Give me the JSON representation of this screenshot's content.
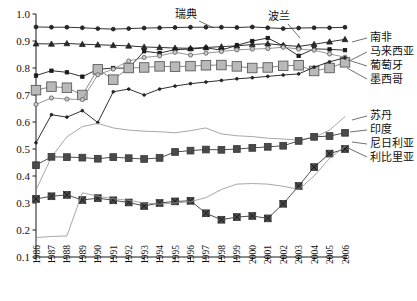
{
  "chart_data": {
    "type": "line",
    "title": "",
    "subtitle": "",
    "xlabel": "",
    "ylabel": "",
    "xlim": [
      1986,
      2006
    ],
    "ylim": [
      0.1,
      1.0
    ],
    "grid": false,
    "legend_position": "inline-annotations",
    "x": [
      1986,
      1987,
      1988,
      1989,
      1990,
      1991,
      1992,
      1993,
      1994,
      1995,
      1996,
      1997,
      1998,
      1999,
      2000,
      2001,
      2002,
      2003,
      2004,
      2005,
      2006
    ],
    "xtick_labels": [
      "1986",
      "1987",
      "1988",
      "1989",
      "1990",
      "1991",
      "1992",
      "1993",
      "1994",
      "1995",
      "1996",
      "1997",
      "1998",
      "1999",
      "2000",
      "2001",
      "2002",
      "2003",
      "2004",
      "2005",
      "2006"
    ],
    "ytick_labels": [
      "0.1",
      "0.2",
      "0.3",
      "0.4",
      "0.5",
      "0.6",
      "0.7",
      "0.8",
      "0.9",
      "1.0"
    ],
    "ytick_values": [
      0.1,
      0.2,
      0.3,
      0.4,
      0.5,
      0.6,
      0.7,
      0.8,
      0.9,
      1.0
    ],
    "series": [
      {
        "name": "瑞典",
        "label": "瑞典",
        "marker": "circle-filled",
        "color": "#1a1a1a",
        "fill": "#2b2b2b",
        "size": 3.1,
        "values": [
          0.952,
          0.951,
          0.951,
          0.949,
          0.946,
          0.944,
          0.946,
          0.948,
          0.949,
          0.95,
          0.951,
          0.951,
          0.951,
          0.95,
          0.952,
          0.949,
          0.946,
          0.948,
          0.949,
          0.949,
          0.951
        ]
      },
      {
        "name": "波兰",
        "label": "波兰",
        "marker": "triangle-filled",
        "color": "#1a1a1a",
        "fill": "#2b2b2b",
        "size": 3.2,
        "values": [
          0.89,
          0.889,
          0.891,
          0.888,
          0.886,
          0.884,
          0.882,
          0.878,
          0.876,
          0.874,
          0.873,
          0.876,
          0.879,
          0.882,
          0.887,
          0.89,
          0.884,
          0.88,
          0.888,
          0.897,
          0.906
        ]
      },
      {
        "name": "南非",
        "label": "南非",
        "marker": "square-small-filled",
        "color": "#1a1a1a",
        "fill": "#1a1a1a",
        "size": 3.0,
        "values": [
          0.772,
          0.79,
          0.784,
          0.768,
          0.795,
          0.8,
          0.799,
          0.862,
          0.855,
          0.868,
          0.87,
          0.875,
          0.866,
          0.884,
          0.9,
          0.911,
          0.882,
          0.845,
          0.871,
          0.869,
          0.866
        ]
      },
      {
        "name": "马来西亚",
        "label": "马来西亚",
        "marker": "square-large-gray",
        "color": "#7a7a7a",
        "fill": "#b9b9b9",
        "size": 5.0,
        "values": [
          0.718,
          0.731,
          0.727,
          0.7,
          0.795,
          0.757,
          0.8,
          0.802,
          0.806,
          0.805,
          0.807,
          0.81,
          0.811,
          0.806,
          0.8,
          0.802,
          0.808,
          0.81,
          0.789,
          0.8,
          0.821
        ]
      },
      {
        "name": "葡萄牙",
        "label": "葡萄牙",
        "marker": "circle-small-gray",
        "color": "#8a8a8a",
        "fill": "#c9c9c9",
        "size": 2.9,
        "values": [
          0.665,
          0.689,
          0.685,
          0.683,
          0.775,
          0.796,
          0.826,
          0.839,
          0.845,
          0.858,
          0.848,
          0.855,
          0.861,
          0.867,
          0.87,
          0.872,
          0.877,
          0.87,
          0.866,
          0.852,
          0.84
        ]
      },
      {
        "name": "墨西哥",
        "label": "墨西哥",
        "marker": "dot-filled",
        "color": "#1a1a1a",
        "fill": "#2b2b2b",
        "size": 2.2,
        "values": [
          0.523,
          0.627,
          0.618,
          0.642,
          0.598,
          0.712,
          0.722,
          0.7,
          0.722,
          0.733,
          0.742,
          0.748,
          0.754,
          0.76,
          0.764,
          0.769,
          0.774,
          0.778,
          0.803,
          0.823,
          0.838
        ]
      },
      {
        "name": "苏丹",
        "label": "苏丹",
        "marker": "line-only",
        "color": "#909090",
        "fill": "none",
        "size": 0,
        "values": [
          0.348,
          0.47,
          0.545,
          0.583,
          0.595,
          0.578,
          0.57,
          0.566,
          0.564,
          0.56,
          0.568,
          0.578,
          0.556,
          0.549,
          0.546,
          0.54,
          0.537,
          0.533,
          0.543,
          0.57,
          0.62
        ]
      },
      {
        "name": "印度",
        "label": "印度",
        "marker": "square-mid-dark",
        "color": "#3a3a3a",
        "fill": "#4a4a4a",
        "size": 4.2,
        "values": [
          0.44,
          0.471,
          0.47,
          0.468,
          0.464,
          0.47,
          0.466,
          0.463,
          0.467,
          0.489,
          0.494,
          0.498,
          0.497,
          0.5,
          0.504,
          0.508,
          0.512,
          0.53,
          0.545,
          0.548,
          0.56
        ]
      },
      {
        "name": "尼日利亚",
        "label": "尼日利亚",
        "marker": "square-x-dark",
        "color": "#3a3a3a",
        "fill": "#4a4a4a",
        "size": 4.2,
        "values": [
          0.315,
          0.325,
          0.33,
          0.311,
          0.318,
          0.31,
          0.302,
          0.289,
          0.3,
          0.306,
          0.308,
          0.262,
          0.238,
          0.248,
          0.252,
          0.243,
          0.297,
          0.363,
          0.433,
          0.483,
          0.5
        ]
      },
      {
        "name": "利比里亚",
        "label": "利比里亚",
        "marker": "line-only",
        "color": "#909090",
        "fill": "none",
        "size": 0,
        "values": [
          0.172,
          0.176,
          0.178,
          0.338,
          0.325,
          0.316,
          0.31,
          0.3,
          0.296,
          0.3,
          0.305,
          0.32,
          0.35,
          0.37,
          0.372,
          0.37,
          0.362,
          0.35,
          0.4,
          0.465,
          0.51
        ]
      }
    ],
    "annotations": [
      {
        "text": "瑞典",
        "x": 175,
        "y": 18,
        "leader": [
          [
            199,
            21
          ],
          [
            214,
            28
          ]
        ]
      },
      {
        "text": "波兰",
        "x": 268,
        "y": 20,
        "leader": [
          [
            288,
            24
          ],
          [
            300,
            38
          ]
        ]
      },
      {
        "text": "南非",
        "x": 370,
        "y": 41,
        "leader": [
          [
            367,
            38
          ],
          [
            352,
            42
          ]
        ]
      },
      {
        "text": "马来西亚",
        "x": 370,
        "y": 55,
        "leader": [
          [
            367,
            52
          ],
          [
            351,
            60
          ]
        ]
      },
      {
        "text": "葡萄牙",
        "x": 370,
        "y": 69,
        "leader": [
          [
            367,
            66
          ],
          [
            348,
            60
          ]
        ]
      },
      {
        "text": "墨西哥",
        "x": 370,
        "y": 83,
        "leader": [
          [
            367,
            79
          ],
          [
            347,
            68
          ]
        ]
      },
      {
        "text": "苏丹",
        "x": 370,
        "y": 119,
        "leader": [
          [
            367,
            116
          ],
          [
            352,
            120
          ]
        ]
      },
      {
        "text": "印度",
        "x": 370,
        "y": 133,
        "leader": [
          [
            367,
            130
          ],
          [
            350,
            132
          ]
        ]
      },
      {
        "text": "尼日利亚",
        "x": 370,
        "y": 147,
        "leader": [
          [
            367,
            144
          ],
          [
            352,
            142
          ]
        ]
      },
      {
        "text": "利比里亚",
        "x": 370,
        "y": 161,
        "leader": [
          [
            367,
            157
          ],
          [
            348,
            148
          ]
        ]
      }
    ]
  }
}
